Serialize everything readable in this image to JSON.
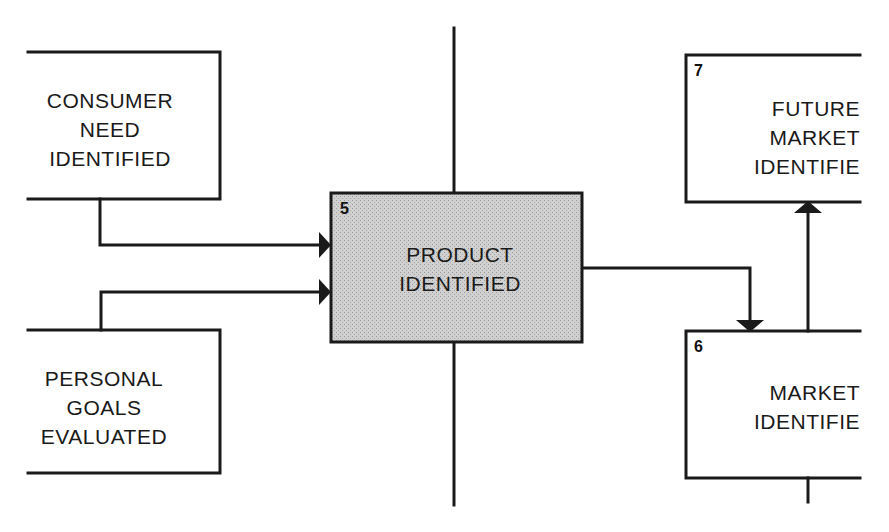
{
  "diagram": {
    "type": "flowchart",
    "colors": {
      "line": "#1a1a1a",
      "highlight_fill": "#c9c9c9",
      "background": "#ffffff"
    },
    "nodes": [
      {
        "id": "consumer",
        "number": "",
        "lines": [
          "CONSUMER",
          "NEED",
          "IDENTIFIED"
        ]
      },
      {
        "id": "personal",
        "number": "",
        "lines": [
          "PERSONAL",
          "GOALS",
          "EVALUATED"
        ]
      },
      {
        "id": "product",
        "number": "5",
        "lines": [
          "PRODUCT",
          "IDENTIFIED"
        ],
        "highlighted": true
      },
      {
        "id": "market",
        "number": "6",
        "lines": [
          "MARKET",
          "IDENTIFIE"
        ]
      },
      {
        "id": "future",
        "number": "7",
        "lines": [
          "FUTURE",
          "MARKET",
          "IDENTIFIE"
        ]
      }
    ],
    "edges": [
      {
        "from": "consumer",
        "to": "product"
      },
      {
        "from": "personal",
        "to": "product"
      },
      {
        "from": "product",
        "to": "market"
      },
      {
        "from": "market",
        "to": "future"
      }
    ]
  }
}
